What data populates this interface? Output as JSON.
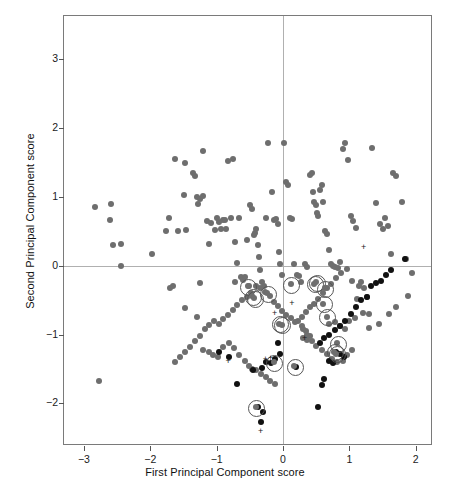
{
  "chart_data": {
    "type": "scatter",
    "title": "",
    "xlabel": "First Principal Component score",
    "ylabel": "Second Principal Component score",
    "xlim": [
      -3.3,
      2.26
    ],
    "ylim": [
      -2.62,
      3.63
    ],
    "xticks": [
      -3,
      -2,
      -1,
      0,
      1,
      2
    ],
    "xticklabels": [
      "−3",
      "−2",
      "−1",
      "0",
      "1",
      "2"
    ],
    "yticks": [
      -2,
      -1,
      0,
      1,
      2,
      3
    ],
    "yticklabels": [
      "−2",
      "−1",
      "0",
      "1",
      "2",
      "3"
    ],
    "grid": false,
    "reference_lines": {
      "vertical_x": 0,
      "horizontal_y": 0,
      "color": "#b0b0b0"
    },
    "legend": null,
    "colors": {
      "gray_point": "#6e6e6e",
      "black_point": "#111111",
      "ring": "#555555",
      "plus": "#1a1a1a",
      "frame": "#7a7a7a"
    },
    "series": [
      {
        "name": "gray points",
        "marker": "filled-circle",
        "color": "#6e6e6e",
        "size_px": 6,
        "points": [
          [
            -2.83,
            0.85
          ],
          [
            -2.61,
            0.66
          ],
          [
            -2.59,
            0.9
          ],
          [
            -2.56,
            0.3
          ],
          [
            -2.44,
            0.31
          ],
          [
            -2.44,
            0.0
          ],
          [
            -2.77,
            -1.67
          ],
          [
            -1.97,
            0.17
          ],
          [
            -1.76,
            0.5
          ],
          [
            -1.72,
            0.7
          ],
          [
            -1.62,
            1.55
          ],
          [
            -1.58,
            0.5
          ],
          [
            -1.49,
            1.03
          ],
          [
            -1.47,
            1.5
          ],
          [
            -1.46,
            0.52
          ],
          [
            -1.36,
            1.35
          ],
          [
            -1.33,
            1.3
          ],
          [
            -1.29,
            1.0
          ],
          [
            -1.28,
            0.9
          ],
          [
            -1.25,
            0.97
          ],
          [
            -1.21,
            1.67
          ],
          [
            -1.2,
            1.02
          ],
          [
            -1.15,
            0.65
          ],
          [
            -1.25,
            -0.25
          ],
          [
            -1.12,
            0.32
          ],
          [
            -1.08,
            0.62
          ],
          [
            -1.03,
            0.52
          ],
          [
            -0.99,
            0.7
          ],
          [
            -0.96,
            0.64
          ],
          [
            -0.93,
            0.53
          ],
          [
            -0.9,
            0.67
          ],
          [
            -0.88,
            0.66
          ],
          [
            -0.86,
            0.53
          ],
          [
            -0.83,
            1.52
          ],
          [
            -0.79,
            0.7
          ],
          [
            -0.76,
            1.55
          ],
          [
            -0.73,
            0.35
          ],
          [
            -0.7,
            0.04
          ],
          [
            -0.72,
            -0.23
          ],
          [
            -0.66,
            0.7
          ],
          [
            -0.63,
            -0.16
          ],
          [
            -0.6,
            -0.21
          ],
          [
            -0.57,
            -0.16
          ],
          [
            -0.54,
            0.37
          ],
          [
            -0.52,
            -0.3
          ],
          [
            -0.5,
            0.88
          ],
          [
            -0.47,
            0.82
          ],
          [
            -0.44,
            0.45
          ],
          [
            -0.42,
            0.47
          ],
          [
            -0.4,
            0.53
          ],
          [
            -0.38,
            0.3
          ],
          [
            -0.36,
            0.13
          ],
          [
            -0.34,
            -0.06
          ],
          [
            -0.31,
            -0.24
          ],
          [
            -0.28,
            -0.3
          ],
          [
            -0.26,
            0.7
          ],
          [
            -0.22,
            1.78
          ],
          [
            -0.17,
            1.07
          ],
          [
            -0.14,
            0.66
          ],
          [
            -0.11,
            0.68
          ],
          [
            -0.08,
            0.61
          ],
          [
            -0.06,
            0.2
          ],
          [
            -0.04,
            0.02
          ],
          [
            -0.02,
            -0.14
          ],
          [
            0.02,
            1.79
          ],
          [
            0.05,
            1.22
          ],
          [
            0.08,
            1.17
          ],
          [
            0.11,
            0.7
          ],
          [
            0.14,
            0.68
          ],
          [
            0.17,
            0.02
          ],
          [
            0.21,
            -0.13
          ],
          [
            0.24,
            -0.15
          ],
          [
            0.27,
            -0.24
          ],
          [
            0.33,
            0.02
          ],
          [
            0.36,
            -0.02
          ],
          [
            0.4,
            1.32
          ],
          [
            0.43,
            1.35
          ],
          [
            0.45,
            1.07
          ],
          [
            0.47,
            0.93
          ],
          [
            0.5,
            0.88
          ],
          [
            0.51,
            0.76
          ],
          [
            0.53,
            0.73
          ],
          [
            0.56,
            1.1
          ],
          [
            0.58,
            1.18
          ],
          [
            0.61,
            0.92
          ],
          [
            0.64,
            0.51
          ],
          [
            0.67,
            0.46
          ],
          [
            0.69,
            0.23
          ],
          [
            0.72,
            0.03
          ],
          [
            0.75,
            0.0
          ],
          [
            0.79,
            -0.02
          ],
          [
            0.83,
            -0.04
          ],
          [
            0.86,
            0.06
          ],
          [
            0.9,
            1.7
          ],
          [
            0.94,
            1.78
          ],
          [
            0.98,
            1.53
          ],
          [
            1.02,
            0.72
          ],
          [
            1.06,
            0.65
          ],
          [
            1.1,
            0.55
          ],
          [
            1.14,
            -0.3
          ],
          [
            1.18,
            -0.23
          ],
          [
            1.22,
            -0.32
          ],
          [
            1.26,
            -0.45
          ],
          [
            1.3,
            -0.7
          ],
          [
            1.34,
            1.71
          ],
          [
            1.4,
            0.91
          ],
          [
            1.46,
            0.6
          ],
          [
            1.5,
            0.53
          ],
          [
            1.54,
            0.69
          ],
          [
            1.58,
            0.58
          ],
          [
            1.62,
            0.17
          ],
          [
            1.66,
            1.35
          ],
          [
            1.7,
            1.3
          ],
          [
            1.8,
            0.92
          ],
          [
            1.85,
            0.1
          ],
          [
            1.94,
            -0.1
          ],
          [
            1.88,
            -0.44
          ],
          [
            1.7,
            -0.6
          ],
          [
            1.6,
            -0.7
          ],
          [
            1.45,
            -0.85
          ],
          [
            1.3,
            -0.9
          ],
          [
            1.21,
            -0.68
          ],
          [
            1.12,
            -0.48
          ],
          [
            1.04,
            -0.22
          ],
          [
            0.96,
            -0.05
          ],
          [
            0.88,
            -0.1
          ],
          [
            0.8,
            -0.18
          ],
          [
            0.73,
            -0.27
          ],
          [
            0.66,
            -0.33
          ],
          [
            0.6,
            -0.4
          ],
          [
            0.53,
            -0.48
          ],
          [
            0.47,
            -0.55
          ],
          [
            0.4,
            -0.6
          ],
          [
            0.34,
            -0.67
          ],
          [
            0.28,
            -0.74
          ],
          [
            0.22,
            -0.8
          ],
          [
            0.28,
            -0.88
          ],
          [
            0.34,
            -0.95
          ],
          [
            0.4,
            -1.02
          ],
          [
            0.36,
            -1.08
          ],
          [
            0.3,
            -1.05
          ],
          [
            0.18,
            -0.82
          ],
          [
            0.12,
            -0.76
          ],
          [
            0.05,
            -0.72
          ],
          [
            -0.01,
            -0.66
          ],
          [
            -0.07,
            -0.58
          ],
          [
            -0.13,
            -0.52
          ],
          [
            -0.2,
            -0.44
          ],
          [
            -0.27,
            -0.38
          ],
          [
            -0.34,
            -0.32
          ],
          [
            -0.41,
            -0.3
          ],
          [
            -0.48,
            -0.4
          ],
          [
            -0.55,
            -0.46
          ],
          [
            -0.62,
            -0.5
          ],
          [
            -0.69,
            -0.57
          ],
          [
            -0.76,
            -0.64
          ],
          [
            -0.83,
            -0.72
          ],
          [
            -0.9,
            -0.78
          ],
          [
            -0.97,
            -0.84
          ],
          [
            -1.04,
            -0.8
          ],
          [
            -1.11,
            -0.86
          ],
          [
            -1.18,
            -0.92
          ],
          [
            -1.25,
            -1.02
          ],
          [
            -1.32,
            -1.1
          ],
          [
            -1.4,
            -1.18
          ],
          [
            -1.48,
            -1.26
          ],
          [
            -1.55,
            -1.33
          ],
          [
            -1.62,
            -1.4
          ],
          [
            -1.48,
            -0.61
          ],
          [
            -1.3,
            -0.75
          ],
          [
            -1.71,
            -0.32
          ],
          [
            -1.66,
            -0.3
          ],
          [
            -1.2,
            -1.22
          ],
          [
            -1.12,
            -1.25
          ],
          [
            -1.05,
            -1.3
          ],
          [
            -0.98,
            -1.33
          ],
          [
            -0.9,
            -1.18
          ],
          [
            -0.82,
            -1.12
          ],
          [
            -0.74,
            -1.2
          ],
          [
            -0.66,
            -1.3
          ],
          [
            -0.58,
            -1.38
          ],
          [
            -0.52,
            -1.45
          ],
          [
            -0.46,
            -1.5
          ],
          [
            -0.4,
            -1.52
          ],
          [
            -0.33,
            -1.58
          ],
          [
            -0.26,
            -1.62
          ],
          [
            -0.19,
            -1.68
          ],
          [
            -0.12,
            -1.72
          ],
          [
            0.3,
            -0.92
          ],
          [
            0.36,
            -1.0
          ],
          [
            0.44,
            -1.1
          ],
          [
            0.5,
            -1.16
          ],
          [
            0.58,
            -1.22
          ],
          [
            0.66,
            -1.28
          ],
          [
            0.74,
            -1.35
          ],
          [
            0.82,
            -1.4
          ],
          [
            0.9,
            -1.38
          ],
          [
            0.97,
            -1.3
          ],
          [
            1.04,
            -1.22
          ],
          [
            0.7,
            -0.85
          ],
          [
            0.78,
            -0.82
          ],
          [
            0.86,
            -0.88
          ],
          [
            0.94,
            -0.92
          ],
          [
            1.0,
            -0.8
          ],
          [
            1.08,
            -0.76
          ]
        ]
      },
      {
        "name": "black points",
        "marker": "filled-circle",
        "color": "#111111",
        "size_px": 6,
        "points": [
          [
            1.84,
            0.1
          ],
          [
            1.62,
            -0.06
          ],
          [
            1.55,
            -0.14
          ],
          [
            1.48,
            -0.22
          ],
          [
            1.4,
            -0.25
          ],
          [
            1.33,
            -0.3
          ],
          [
            1.26,
            -0.46
          ],
          [
            1.18,
            -0.5
          ],
          [
            1.1,
            -0.6
          ],
          [
            1.02,
            -0.7
          ],
          [
            0.94,
            -0.8
          ],
          [
            0.86,
            -0.88
          ],
          [
            0.78,
            -0.94
          ],
          [
            0.7,
            -1.0
          ],
          [
            0.62,
            -1.05
          ],
          [
            0.55,
            -1.12
          ],
          [
            0.8,
            -1.25
          ],
          [
            0.86,
            -1.28
          ],
          [
            0.92,
            -1.32
          ],
          [
            0.7,
            -1.38
          ],
          [
            0.76,
            -1.42
          ],
          [
            0.62,
            -1.65
          ],
          [
            0.58,
            -1.74
          ],
          [
            0.52,
            -2.05
          ],
          [
            0.2,
            -1.47
          ],
          [
            -0.05,
            -1.28
          ],
          [
            -0.12,
            -1.35
          ],
          [
            -0.18,
            -1.42
          ],
          [
            -0.25,
            -1.4
          ],
          [
            -0.32,
            -1.48
          ],
          [
            -0.08,
            -1.12
          ],
          [
            -0.96,
            -1.25
          ],
          [
            -0.82,
            -1.33
          ],
          [
            -0.7,
            -1.72
          ],
          [
            -0.38,
            -2.06
          ],
          [
            -0.3,
            -2.12
          ],
          [
            -0.33,
            -2.27
          ],
          [
            -0.45,
            -1.52
          ]
        ]
      },
      {
        "name": "circled points",
        "marker": "circle-with-ring",
        "color": "#6e6e6e",
        "ring_color": "#555555",
        "size_px": 6,
        "ring_px": 15,
        "points": [
          [
            -0.53,
            -0.3
          ],
          [
            -0.46,
            -0.44
          ],
          [
            -0.43,
            -0.47
          ],
          [
            -0.24,
            -0.4
          ],
          [
            0.12,
            -0.27
          ],
          [
            0.47,
            -0.26
          ],
          [
            0.5,
            -0.24
          ],
          [
            0.63,
            -0.33
          ],
          [
            0.61,
            -0.55
          ],
          [
            0.66,
            -0.74
          ],
          [
            -0.06,
            -0.84
          ],
          [
            -0.02,
            -0.86
          ],
          [
            0.82,
            -1.13
          ],
          [
            0.8,
            -1.28
          ],
          [
            0.77,
            -1.25
          ],
          [
            -0.14,
            -1.4
          ],
          [
            0.17,
            -1.46
          ],
          [
            -0.41,
            -2.06
          ]
        ]
      },
      {
        "name": "plus markers",
        "marker": "plus",
        "color": "#1a1a1a",
        "size_px": 7,
        "points": [
          [
            1.22,
            0.26
          ],
          [
            0.14,
            -0.56
          ],
          [
            -0.12,
            -0.7
          ],
          [
            0.33,
            -1.06
          ],
          [
            -0.26,
            -1.37
          ],
          [
            -0.18,
            -1.36
          ],
          [
            -0.82,
            -1.4
          ],
          [
            -0.33,
            -2.42
          ]
        ]
      }
    ]
  },
  "axes": {
    "x_label_text": "First Principal Component score",
    "y_label_text": "Second Principal Component score"
  }
}
